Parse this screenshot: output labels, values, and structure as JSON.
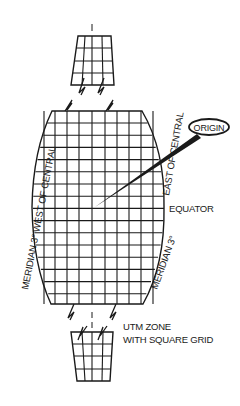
{
  "diagram": {
    "title": "UTM zone with square grid",
    "labels": {
      "origin": "ORIGIN",
      "equator": "EQUATOR",
      "meridian_west": "MERIDIAN 3° WEST OF CENTRAL",
      "meridian_east_upper": "EAST OF CENTRAL",
      "meridian_east_lower": "MERIDIAN 3°",
      "caption_line1": "UTM ZONE",
      "caption_line2": "WITH SQUARE GRID"
    },
    "colors": {
      "ink": "#1a1a1a",
      "background": "#ffffff"
    }
  }
}
